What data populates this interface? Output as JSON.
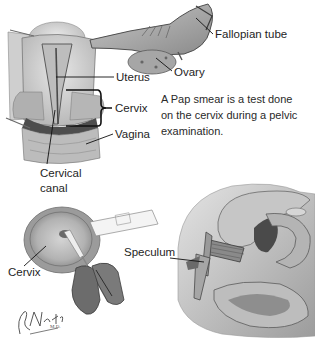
{
  "figure": {
    "caption_lines": [
      "A Pap smear is a test done",
      "on the cervix during a pelvic",
      "examination."
    ],
    "labels": {
      "fallopian_tube": "Fallopian tube",
      "ovary": "Ovary",
      "uterus": "Uterus",
      "cervix_top": "Cervix",
      "vagina": "Vagina",
      "cervical_canal_line1": "Cervical",
      "cervical_canal_line2": "canal",
      "cervix_bottom": "Cervix",
      "speculum": "Speculum"
    },
    "signature": "F. Netter M.D.",
    "colors": {
      "background": "#ffffff",
      "tissue_light": "#d9d9d9",
      "tissue_mid": "#a8a8a8",
      "tissue_dark": "#5a5a5a",
      "outline": "#3a3a3a",
      "leader_line": "#111111"
    }
  }
}
